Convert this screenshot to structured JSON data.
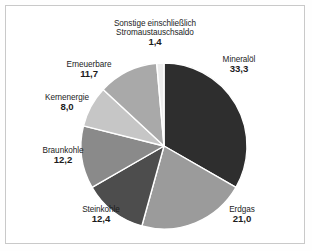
{
  "chart_data": {
    "type": "pie",
    "title": "",
    "subtitle": "",
    "xlabel": "",
    "ylabel": "",
    "legend_position": "labels-around-pie",
    "grid": false,
    "start_angle_deg": 0,
    "direction": "clockwise",
    "categories": [
      "Mineralöl",
      "Erdgas",
      "Steinkohle",
      "Braunkohle",
      "Kernenergie",
      "Erneuerbare",
      "Sonstige einschließlich Stromaustauschsaldo"
    ],
    "values": [
      33.3,
      21.0,
      12.4,
      12.2,
      8.0,
      11.7,
      1.4
    ],
    "value_labels": [
      "33,3",
      "21,0",
      "12,4",
      "12,2",
      "8,0",
      "11,7",
      "1,4"
    ],
    "colors": [
      "#2e2e2e",
      "#9b9b9b",
      "#4d4d4d",
      "#8a8a8a",
      "#c6c6c6",
      "#a9a9a9",
      "#ececec"
    ],
    "slice_separator_color": "#ffffff",
    "total": 100.0
  },
  "slices": [
    {
      "key": "mineraloel",
      "name": "Mineralöl",
      "value_label": "33,3",
      "value": 33.3,
      "color": "#2e2e2e"
    },
    {
      "key": "erdgas",
      "name": "Erdgas",
      "value_label": "21,0",
      "value": 21.0,
      "color": "#9b9b9b"
    },
    {
      "key": "steinkohle",
      "name": "Steinkohle",
      "value_label": "12,4",
      "value": 12.4,
      "color": "#4d4d4d"
    },
    {
      "key": "braunkohle",
      "name": "Braunkohle",
      "value_label": "12,2",
      "value": 12.2,
      "color": "#8a8a8a"
    },
    {
      "key": "kernenergie",
      "name": "Kernenergie",
      "value_label": "8,0",
      "value": 8.0,
      "color": "#c6c6c6"
    },
    {
      "key": "erneuerbare",
      "name": "Erneuerbare",
      "value_label": "11,7",
      "value": 11.7,
      "color": "#a9a9a9"
    },
    {
      "key": "sonstige",
      "name_line1": "Sonstige einschließlich",
      "name_line2": "Stromaustauschsaldo",
      "value_label": "1,4",
      "value": 1.4,
      "color": "#ececec"
    }
  ],
  "style": {
    "frame_border_color": "#c9c9c9",
    "background_color": "#ffffff",
    "text_color": "#1c1c1c"
  }
}
